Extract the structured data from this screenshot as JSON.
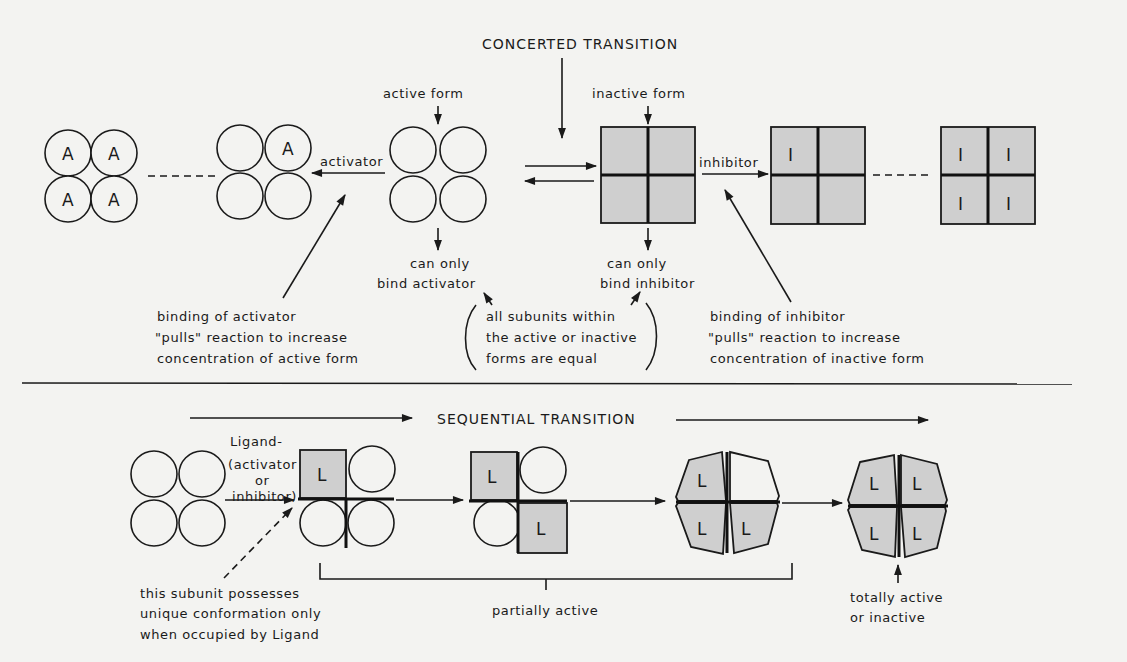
{
  "figure": {
    "colors": {
      "background": "#f3f3f1",
      "ink": "#1a1a1a",
      "shaded_subunit": "#cfcfcf"
    },
    "concerted": {
      "title": "CONCERTED TRANSITION",
      "active_form_label": "active form",
      "inactive_form_label": "inactive form",
      "activator_arrow_label": "activator",
      "inhibitor_arrow_label": "inhibitor",
      "active_binds_line1": "can only",
      "active_binds_line2": "bind activator",
      "inactive_binds_line1": "can only",
      "inactive_binds_line2": "bind inhibitor",
      "equal_note": [
        "all subunits within",
        "the active or inactive",
        "forms are equal"
      ],
      "activator_note": [
        "binding of activator",
        "\"pulls\" reaction to increase",
        "concentration of active form"
      ],
      "inhibitor_note": [
        "binding of inhibitor",
        "\"pulls\" reaction to increase",
        "concentration of inactive form"
      ],
      "activator_symbol": "A",
      "inhibitor_symbol": "I"
    },
    "sequential": {
      "title": "SEQUENTIAL TRANSITION",
      "ligand_label": [
        "Ligand-",
        "(activator",
        "or",
        "inhibitor)"
      ],
      "ligand_symbol": "L",
      "subunit_note": [
        "this subunit possesses",
        "unique conformation only",
        "when occupied by Ligand"
      ],
      "partial_label": "partially active",
      "total_label": [
        "totally active",
        "or inactive"
      ]
    }
  }
}
